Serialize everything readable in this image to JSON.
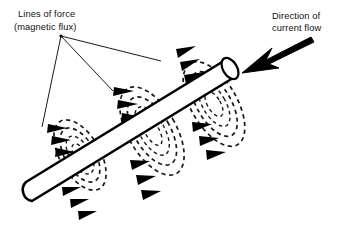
{
  "figure": {
    "background_color": "#ffffff",
    "ink_color": "#000000",
    "width": 338,
    "height": 244
  },
  "labels": {
    "flux": {
      "line1": "Lines of force",
      "line2": "(magnetic flux)",
      "x": 18,
      "y": 17
    },
    "current": {
      "line1": "Direction of",
      "line2": "current flow",
      "x": 272,
      "y": 19
    }
  },
  "leader_lines": {
    "origin": {
      "x": 61,
      "y": 36
    },
    "targets": [
      {
        "name": "left-coil",
        "x": 42,
        "y": 127
      },
      {
        "name": "middle-coil",
        "x": 113,
        "y": 91
      },
      {
        "name": "top-coil",
        "x": 161,
        "y": 61
      }
    ]
  },
  "conductor": {
    "name": "current-carrying-conductor",
    "start": {
      "x": 26,
      "y": 192
    },
    "end": {
      "x": 238,
      "y": 68
    },
    "radius": 11,
    "near_end_cap": "rounded",
    "far_end_cap": "ellipse"
  },
  "current_arrow": {
    "name": "current-flow-arrow",
    "tail": {
      "x": 311,
      "y": 37
    },
    "tip": {
      "x": 242,
      "y": 73
    },
    "direction": "down-left"
  },
  "flux_coils": [
    {
      "name": "flux-coil-left",
      "center": {
        "x": 80,
        "y": 155
      },
      "rings": 4,
      "arrow_groups": [
        {
          "position": "upper-left",
          "count": 3,
          "direction": "right"
        },
        {
          "position": "lower-right",
          "count": 3,
          "direction": "right-down"
        }
      ]
    },
    {
      "name": "flux-coil-middle",
      "center": {
        "x": 152,
        "y": 131
      },
      "rings": 4,
      "arrow_groups": [
        {
          "position": "upper-left",
          "count": 3,
          "direction": "right"
        },
        {
          "position": "lower-right",
          "count": 3,
          "direction": "right-down"
        }
      ]
    },
    {
      "name": "flux-coil-top",
      "center": {
        "x": 214,
        "y": 104
      },
      "rings": 4,
      "arrow_groups": [
        {
          "position": "upper-left",
          "count": 3,
          "direction": "right-up"
        },
        {
          "position": "lower-right",
          "count": 3,
          "direction": "right-down"
        }
      ]
    }
  ]
}
